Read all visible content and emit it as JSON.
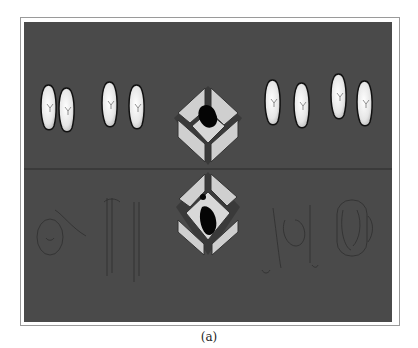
{
  "figure": {
    "caption": "(a)",
    "background_color": "#4a4a4a",
    "frame_color": "#9a9a9a",
    "divider_line_y": 169
  },
  "scene": {
    "top_row": {
      "description": "rendered foot pairs",
      "pairs": [
        {
          "label": "foot-pair-1",
          "x": 40
        },
        {
          "label": "foot-pair-2",
          "x": 101
        },
        {
          "label": "foot-pair-3",
          "x": 265
        },
        {
          "label": "foot-pair-4",
          "x": 330
        }
      ]
    },
    "center_top": {
      "label": "pressure-cube-top",
      "blob_color": "#000000",
      "face_color": "#cfcfcf"
    },
    "center_bottom": {
      "label": "pressure-cube-bottom",
      "blob_color": "#000000",
      "face_color": "#cfcfcf"
    },
    "bottom_row": {
      "description": "faint wireframe foot outlines",
      "items": [
        "wireframe-left-1",
        "wireframe-left-2",
        "wireframe-right-1",
        "wireframe-right-2"
      ]
    }
  }
}
